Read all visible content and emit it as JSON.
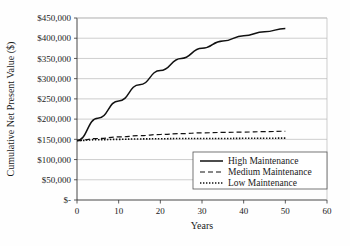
{
  "chart_data": {
    "type": "line",
    "title": "",
    "xlabel": "Years",
    "ylabel": "Cumulative Net Present Value ($)",
    "xlim": [
      0,
      60
    ],
    "ylim": [
      0,
      450000
    ],
    "grid": "horizontal",
    "legend_position": "inside-lower-right",
    "x_ticks": [
      "0",
      "10",
      "20",
      "30",
      "40",
      "50",
      "60"
    ],
    "x_tick_values": [
      0,
      10,
      20,
      30,
      40,
      50,
      60
    ],
    "y_ticks": [
      "$-",
      "$50,000",
      "$100,000",
      "$150,000",
      "$200,000",
      "$250,000",
      "$300,000",
      "$350,000",
      "$400,000",
      "$450,000"
    ],
    "y_tick_values": [
      0,
      50000,
      100000,
      150000,
      200000,
      250000,
      300000,
      350000,
      400000,
      450000
    ],
    "x": [
      0,
      5,
      10,
      15,
      20,
      25,
      30,
      35,
      40,
      45,
      50
    ],
    "series": [
      {
        "name": "High Maintenance",
        "style": "solid",
        "values": [
          147000,
          202000,
          245000,
          285000,
          320000,
          350000,
          375000,
          393000,
          406000,
          416000,
          424000
        ]
      },
      {
        "name": "Medium Maintenance",
        "style": "dashed",
        "values": [
          147000,
          152000,
          156000,
          159000,
          162000,
          164000,
          166000,
          167000,
          168000,
          169000,
          170000
        ]
      },
      {
        "name": "Low Maintenance",
        "style": "dotted",
        "values": [
          147000,
          149000,
          150000,
          151000,
          151500,
          152000,
          152000,
          152000,
          152500,
          152500,
          153000
        ]
      }
    ]
  },
  "legend": {
    "entries": [
      {
        "label": "High Maintenance",
        "style": "solid"
      },
      {
        "label": "Medium Maintenance",
        "style": "dashed"
      },
      {
        "label": "Low Maintenance",
        "style": "dotted"
      }
    ]
  },
  "colors": {
    "line": "#111111",
    "grid": "#b9b9b9",
    "axis": "#333333",
    "background": "#fefefe"
  }
}
